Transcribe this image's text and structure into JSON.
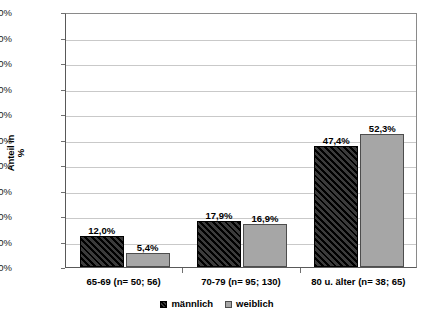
{
  "chart_data": {
    "type": "bar",
    "title": "",
    "xlabel": "",
    "ylabel": "Anteil in %",
    "ylabel_line1": "Anteil in",
    "ylabel_line2": "%",
    "ylim": [
      0,
      100
    ],
    "ytick_labels": [
      "100%",
      "90%",
      "80%",
      "70%",
      "60%",
      "50%",
      "40%",
      "30%",
      "20%",
      "10%",
      "0%"
    ],
    "ytick_values": [
      100,
      90,
      80,
      70,
      60,
      50,
      40,
      30,
      20,
      10,
      0
    ],
    "grid": true,
    "legend_position": "bottom-center",
    "categories": [
      "65-69 (n= 50; 56)",
      "70-79 (n= 95; 130)",
      "80 u. älter (n= 38; 65)"
    ],
    "series": [
      {
        "name": "männlich",
        "color": "#1c1c1c",
        "pattern": "diagonal-hatch",
        "values": [
          12.0,
          17.9,
          47.4
        ],
        "labels": [
          "12,0%",
          "17,9%",
          "47,4%"
        ]
      },
      {
        "name": "weiblich",
        "color": "#a6a6a6",
        "pattern": "solid",
        "values": [
          5.4,
          16.9,
          52.3
        ],
        "labels": [
          "5,4%",
          "16,9%",
          "52,3%"
        ]
      }
    ]
  },
  "legend": {
    "items": [
      {
        "label": "männlich"
      },
      {
        "label": "weiblich"
      }
    ]
  },
  "colors": {
    "male_bar": "#1c1c1c",
    "female_bar": "#a6a6a6",
    "gridline": "#c9c9c9",
    "axis": "#595959",
    "background": "#ffffff"
  }
}
